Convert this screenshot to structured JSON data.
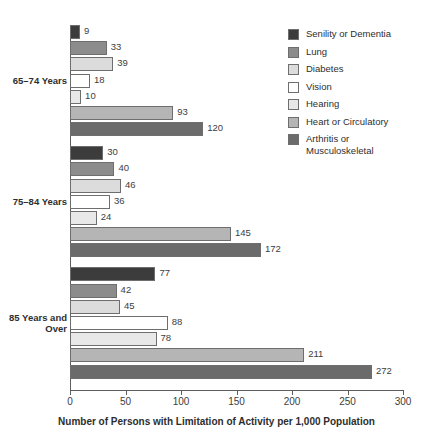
{
  "chart_data": {
    "type": "bar",
    "orientation": "horizontal",
    "title": "",
    "xlabel": "Number of Persons with Limitation of Activity per 1,000 Population",
    "ylabel": "",
    "xlim": [
      0,
      300
    ],
    "xticks": [
      0,
      50,
      100,
      150,
      200,
      250,
      300
    ],
    "xtick_labels": [
      "0",
      "50",
      "100",
      "150",
      "200",
      "250",
      "300"
    ],
    "grid": false,
    "legend_position": "right",
    "categories": [
      "65–74 Years",
      "75–84 Years",
      "85 Years and\nOver"
    ],
    "series": [
      {
        "name": "Senility or Dementia",
        "color": "#3c3c3c",
        "values": [
          9,
          30,
          77
        ]
      },
      {
        "name": "Lung",
        "color": "#8c8c8c",
        "values": [
          33,
          40,
          42
        ]
      },
      {
        "name": "Diabetes",
        "color": "#dcdcdc",
        "values": [
          39,
          46,
          45
        ]
      },
      {
        "name": "Vision",
        "color": "#ffffff",
        "values": [
          18,
          36,
          88
        ]
      },
      {
        "name": "Hearing",
        "color": "#e8e8e8",
        "values": [
          10,
          24,
          78
        ]
      },
      {
        "name": "Heart or Circulatory",
        "color": "#b5b5b5",
        "values": [
          93,
          145,
          211
        ]
      },
      {
        "name": "Arthritis or\nMusculoskeletal",
        "color": "#6b6b6b",
        "values": [
          120,
          172,
          272
        ]
      }
    ]
  },
  "legend": {
    "items": [
      {
        "label": "Senility or Dementia"
      },
      {
        "label": "Lung"
      },
      {
        "label": "Diabetes"
      },
      {
        "label": "Vision"
      },
      {
        "label": "Hearing"
      },
      {
        "label": "Heart or Circulatory"
      },
      {
        "label": "Arthritis or\nMusculoskeletal"
      }
    ]
  }
}
